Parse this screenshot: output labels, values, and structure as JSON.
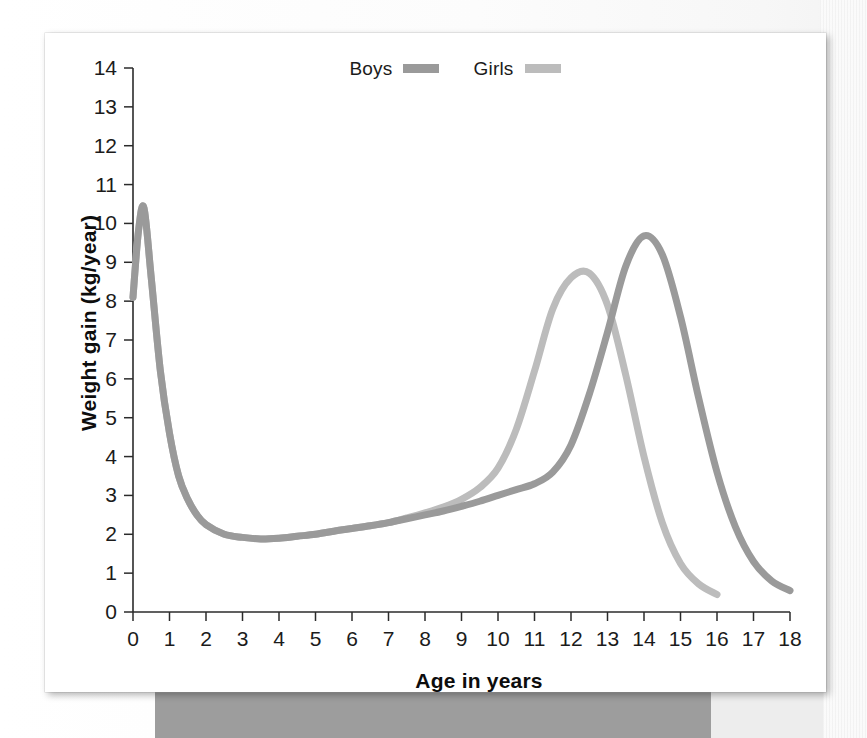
{
  "figure": {
    "background_color": "#ffffff",
    "card_color": "#ffffff",
    "band_color": "#9d9d9d"
  },
  "legend": {
    "position": "top-center",
    "entries": [
      {
        "label": "Boys",
        "color": "#9a9a9a",
        "swatch_name": "legend-swatch-boys"
      },
      {
        "label": "Girls",
        "color": "#bcbcbc",
        "swatch_name": "legend-swatch-girls"
      }
    ]
  },
  "axes": {
    "xlabel": "Age in years",
    "ylabel": "Weight gain (kg/year)",
    "xticks": [
      "0",
      "1",
      "2",
      "3",
      "4",
      "5",
      "6",
      "7",
      "8",
      "9",
      "10",
      "11",
      "12",
      "13",
      "14",
      "15",
      "16",
      "17",
      "18"
    ],
    "yticks": [
      "0",
      "1",
      "2",
      "3",
      "4",
      "5",
      "6",
      "7",
      "8",
      "9",
      "10",
      "11",
      "12",
      "13",
      "14"
    ]
  },
  "chart_data": {
    "type": "line",
    "title": "",
    "subtitle": "",
    "xlabel": "Age in years",
    "ylabel": "Weight gain (kg/year)",
    "xlim": [
      0,
      18
    ],
    "ylim": [
      0,
      14
    ],
    "grid": false,
    "legend_position": "top-center",
    "xticks": [
      0,
      1,
      2,
      3,
      4,
      5,
      6,
      7,
      8,
      9,
      10,
      11,
      12,
      13,
      14,
      15,
      16,
      17,
      18
    ],
    "yticks": [
      0,
      1,
      2,
      3,
      4,
      5,
      6,
      7,
      8,
      9,
      10,
      11,
      12,
      13,
      14
    ],
    "annotations": [
      "Infancy peak near 0.3 years at about 10.4 kg/year",
      "Childhood trough near 3.5 years at about 1.9 kg/year",
      "Girls pubertal peak at about 12.5 years, 8.7 kg/year",
      "Boys pubertal peak at about 14.0 years, 9.7 kg/year",
      "Girls curve ends at 16 years, Boys curve ends at 18 years"
    ],
    "series": [
      {
        "name": "Boys",
        "color": "#9a9a9a",
        "linewidth": 7,
        "x": [
          0,
          0.15,
          0.3,
          0.5,
          0.75,
          1.0,
          1.25,
          1.5,
          1.75,
          2.0,
          2.5,
          3.0,
          3.5,
          4.0,
          4.5,
          5.0,
          5.5,
          6.0,
          6.5,
          7.0,
          7.5,
          8.0,
          8.5,
          9.0,
          9.5,
          10.0,
          10.5,
          11.0,
          11.5,
          12.0,
          12.5,
          13.0,
          13.5,
          14.0,
          14.5,
          15.0,
          15.5,
          16.0,
          16.5,
          17.0,
          17.5,
          18.0
        ],
        "y": [
          8.1,
          9.8,
          10.4,
          8.6,
          6.2,
          4.6,
          3.5,
          2.9,
          2.5,
          2.25,
          2.0,
          1.92,
          1.88,
          1.9,
          1.95,
          2.0,
          2.08,
          2.15,
          2.22,
          2.3,
          2.4,
          2.5,
          2.6,
          2.72,
          2.85,
          3.0,
          3.15,
          3.3,
          3.6,
          4.3,
          5.6,
          7.2,
          8.9,
          9.68,
          9.2,
          7.6,
          5.5,
          3.6,
          2.2,
          1.3,
          0.8,
          0.55
        ]
      },
      {
        "name": "Girls",
        "color": "#bcbcbc",
        "linewidth": 7,
        "x": [
          0,
          0.15,
          0.3,
          0.5,
          0.75,
          1.0,
          1.25,
          1.5,
          1.75,
          2.0,
          2.5,
          3.0,
          3.5,
          4.0,
          4.5,
          5.0,
          5.5,
          6.0,
          6.5,
          7.0,
          7.5,
          8.0,
          8.5,
          9.0,
          9.5,
          10.0,
          10.5,
          11.0,
          11.5,
          12.0,
          12.5,
          13.0,
          13.5,
          14.0,
          14.5,
          15.0,
          15.5,
          16.0
        ],
        "y": [
          8.1,
          9.8,
          10.4,
          8.6,
          6.2,
          4.6,
          3.5,
          2.9,
          2.5,
          2.25,
          2.0,
          1.92,
          1.88,
          1.9,
          1.95,
          2.0,
          2.08,
          2.15,
          2.22,
          2.3,
          2.42,
          2.55,
          2.7,
          2.9,
          3.2,
          3.7,
          4.7,
          6.2,
          7.8,
          8.6,
          8.72,
          7.9,
          6.1,
          4.0,
          2.3,
          1.25,
          0.72,
          0.45
        ]
      }
    ]
  }
}
